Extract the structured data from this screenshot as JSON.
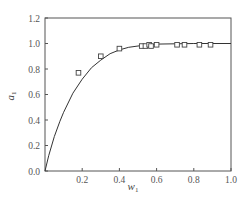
{
  "chart_data": {
    "type": "line",
    "title": "",
    "xlabel": "w",
    "xlabel_sub": "1",
    "ylabel": "a",
    "ylabel_sub": "1",
    "xlim": [
      0,
      1.0
    ],
    "ylim": [
      0,
      1.2
    ],
    "xticks": [
      "0.2",
      "0.4",
      "0.6",
      "0.8",
      "1.0"
    ],
    "yticks": [
      "0.0",
      "0.2",
      "0.4",
      "0.6",
      "0.8",
      "1.0",
      "1.2"
    ],
    "grid": false,
    "legend": null,
    "series": [
      {
        "name": "model curve",
        "style": "solid-line",
        "x": [
          0,
          0.02,
          0.05,
          0.08,
          0.1,
          0.15,
          0.2,
          0.25,
          0.3,
          0.35,
          0.4,
          0.45,
          0.5,
          0.55,
          0.6,
          0.7,
          0.8,
          0.9,
          1.0
        ],
        "y": [
          0,
          0.12,
          0.27,
          0.39,
          0.46,
          0.61,
          0.72,
          0.81,
          0.87,
          0.92,
          0.95,
          0.97,
          0.98,
          0.99,
          0.995,
          0.998,
          1.0,
          1.0,
          1.0
        ]
      },
      {
        "name": "experimental",
        "style": "open-square-markers",
        "x": [
          0.18,
          0.3,
          0.4,
          0.52,
          0.54,
          0.56,
          0.57,
          0.6,
          0.71,
          0.75,
          0.83,
          0.89
        ],
        "y": [
          0.77,
          0.9,
          0.96,
          0.98,
          0.98,
          0.99,
          0.98,
          0.99,
          0.99,
          0.99,
          0.99,
          0.99
        ]
      }
    ]
  }
}
